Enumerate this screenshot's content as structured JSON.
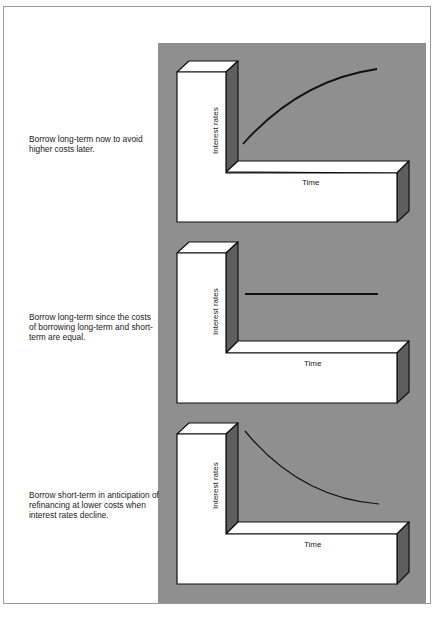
{
  "panels": [
    {
      "caption": "Borrow long-term now to avoid higher costs later.",
      "y_label": "Interest rates",
      "x_label": "Time",
      "trend": "rising"
    },
    {
      "caption": "Borrow long-term since the costs of borrowing long-term and short-term are equal.",
      "y_label": "Interest rates",
      "x_label": "Time",
      "trend": "flat"
    },
    {
      "caption": "Borrow short-term in anticipation of refinancing at lower costs when interest rates decline.",
      "y_label": "Interest rates",
      "x_label": "Time",
      "trend": "declining"
    }
  ],
  "colors": {
    "panel_background": "#8f8f8f",
    "block_face": "#ffffff",
    "block_side": "#5e5e5e",
    "curve": "#111111"
  }
}
